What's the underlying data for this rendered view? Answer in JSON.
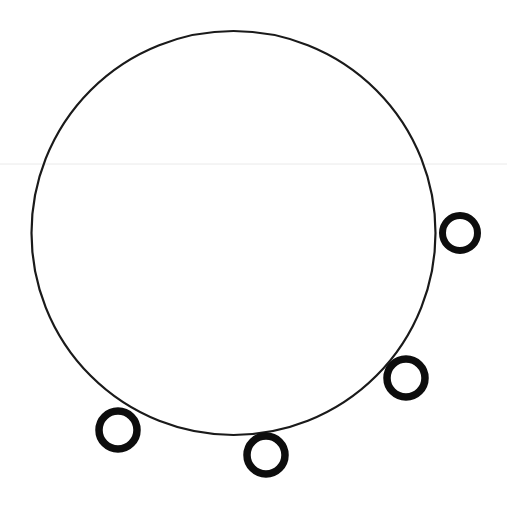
{
  "figure": {
    "title": "Hand-drawn circle with four small circles on its lower-right arc",
    "width": 507,
    "height": 505,
    "background_color": "#ffffff",
    "ink_color": "#101010",
    "artifact_line_color": "#e8e8e8"
  },
  "main_circle": {
    "label": "main-circle",
    "center_x": 233.5,
    "center_y": 233,
    "radius": 202,
    "stroke_width": 2.2,
    "stroke_color": "#1a1a1a",
    "fill": "none"
  },
  "small_circles": [
    {
      "label": "small-circle-right",
      "position_name": "right",
      "center_x": 460,
      "center_y": 233,
      "radius": 17.5,
      "stroke_width": 7,
      "stroke_color": "#0d0d0d",
      "fill": "none",
      "angle_degrees": 0
    },
    {
      "label": "small-circle-lower-right",
      "position_name": "lower-right",
      "center_x": 406,
      "center_y": 378,
      "radius": 19,
      "stroke_width": 7.5,
      "stroke_color": "#0d0d0d",
      "fill": "none",
      "angle_degrees": 45
    },
    {
      "label": "small-circle-bottom",
      "position_name": "bottom",
      "center_x": 266,
      "center_y": 455,
      "radius": 19,
      "stroke_width": 7.5,
      "stroke_color": "#0d0d0d",
      "fill": "none",
      "angle_degrees": 81
    },
    {
      "label": "small-circle-lower-left",
      "position_name": "lower-left",
      "center_x": 118,
      "center_y": 430,
      "radius": 19,
      "stroke_width": 7.5,
      "stroke_color": "#0d0d0d",
      "fill": "none",
      "angle_degrees": 123
    }
  ],
  "scan_artifact": {
    "label": "faint-horizontal-scan-line",
    "y": 164,
    "x_start": 0,
    "x_end": 507,
    "stroke_width": 1,
    "stroke_color": "#eaeaea"
  },
  "chart_data": {
    "type": "scatter",
    "title": "Hand-drawn circle with four small circles on its lower-right arc",
    "xlabel": "",
    "ylabel": "",
    "xlim": [
      0,
      507
    ],
    "ylim": [
      505,
      0
    ],
    "grid": false,
    "legend": "none",
    "series": [
      {
        "name": "main-circle",
        "shape": "circle-outline",
        "x": [
          233.5
        ],
        "y": [
          233
        ],
        "radii": [
          202
        ],
        "stroke_width": 2.2
      },
      {
        "name": "small-circles",
        "shape": "circle-outline",
        "x": [
          460,
          406,
          266,
          118
        ],
        "y": [
          233,
          378,
          455,
          430
        ],
        "radii": [
          17.5,
          19,
          19,
          19
        ],
        "stroke_width": 7.5
      }
    ],
    "annotations": []
  }
}
